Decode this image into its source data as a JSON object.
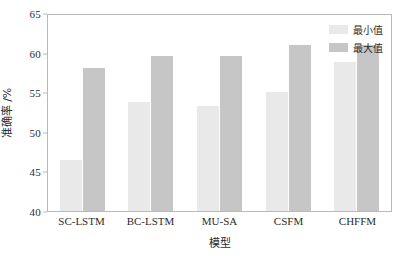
{
  "chart_data": {
    "type": "bar",
    "title": "",
    "subtitle": "",
    "xlabel": "模型",
    "ylabel": "准确率 /%",
    "categories": [
      "SC-LSTM",
      "BC-LSTM",
      "MU-SA",
      "CSFM",
      "CHFFM"
    ],
    "series": [
      {
        "name": "最小值",
        "color": "#e9e9e9",
        "values": [
          46.4,
          53.8,
          53.3,
          55.0,
          58.8
        ]
      },
      {
        "name": "最大值",
        "color": "#c6c6c6",
        "values": [
          58.0,
          59.6,
          59.6,
          61.0,
          61.0
        ]
      }
    ],
    "ylim": [
      40,
      65
    ],
    "yticks": [
      40,
      45,
      50,
      55,
      60,
      65
    ],
    "ytick_labels": [
      "40",
      "45",
      "50",
      "55",
      "60",
      "65"
    ],
    "grid": false,
    "legend_position": "top-right-inside",
    "frame": true
  }
}
